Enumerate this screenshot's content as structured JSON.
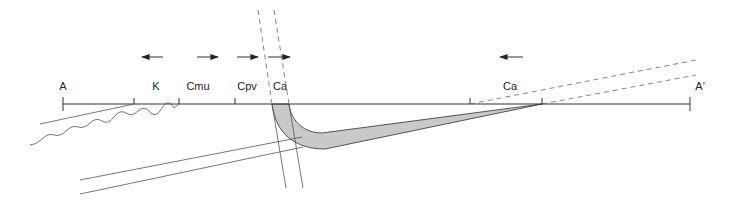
{
  "diagram": {
    "type": "cross-section schematic",
    "baseline": {
      "label_start": "A",
      "label_end": "A′"
    },
    "labels": [
      {
        "id": "A",
        "text": "A",
        "x": 63
      },
      {
        "id": "K",
        "text": "K",
        "x": 156
      },
      {
        "id": "Cmu",
        "text": "Cmu",
        "x": 198
      },
      {
        "id": "Cpv",
        "text": "Cpv",
        "x": 247
      },
      {
        "id": "Ca1",
        "text": "Ca",
        "x": 279
      },
      {
        "id": "Ca2",
        "text": "Ca",
        "x": 510
      },
      {
        "id": "A_prime",
        "text": "A′",
        "x": 698
      }
    ],
    "arrows": [
      {
        "id": "arrow-K",
        "direction": "left"
      },
      {
        "id": "arrow-Cmu",
        "direction": "right"
      },
      {
        "id": "arrow-Cpv",
        "direction": "right"
      },
      {
        "id": "arrow-Ca1",
        "direction": "right"
      },
      {
        "id": "arrow-Ca2",
        "direction": "left"
      }
    ],
    "colors": {
      "line": "#333333",
      "band_fill": "#c9c9c9",
      "arrow": "#555555"
    }
  }
}
